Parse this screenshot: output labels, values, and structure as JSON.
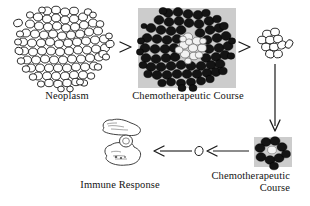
{
  "figure": {
    "type": "biomedical-flow-diagram",
    "background_color": "#ffffff",
    "ink_color": "#141414",
    "plate_background_color": "#cfcfcf",
    "cell_dark_color": "#141414",
    "cell_light_fill": "#ffffff"
  },
  "captions": {
    "neoplasm": "Neoplasm",
    "chemo_course_top": "Chemotherapeutic Course",
    "chemo_course_bottom_line1": "Chemotherapeutic",
    "chemo_course_bottom_line2": "Course",
    "immune_response": "Immune Response"
  },
  "nodes": {
    "neoplasm_cluster": {
      "label": "Neoplasm",
      "description": "large dense cluster of outlined unfilled tumor cells",
      "cell_count": 104,
      "cell_style": "outline"
    },
    "treated_cluster_large": {
      "label": "Chemotherapeutic Course",
      "description": "photographic plate: dark filled tumor cells surrounding a pale white core",
      "cell_count": 96,
      "cell_style": "filled-dark",
      "core_cell_count": 13,
      "core_cell_style": "filled-light"
    },
    "residual_cluster_small": {
      "label": "",
      "description": "small group of surviving outlined cells",
      "cell_count": 11,
      "cell_style": "outline"
    },
    "treated_cluster_small": {
      "label": "Chemotherapeutic Course",
      "description": "photographic plate: small dark cell cluster with pale core",
      "cell_count": 9,
      "cell_style": "filled-dark",
      "core_cell_count": 1,
      "core_cell_style": "filled-light"
    },
    "single_cell": {
      "label": "",
      "description": "single residual outlined cell",
      "cell_count": 1,
      "cell_style": "outline"
    },
    "immune_cells": {
      "label": "Immune Response",
      "description": "two outlined amoeboid immune cells (macrophage / lymphocyte) engulfing target",
      "cell_count": 2,
      "cell_style": "outline-amoeboid"
    }
  },
  "arrows": [
    {
      "name": "neoplasm-to-treated",
      "direction": "right",
      "from": "neoplasm_cluster",
      "to": "treated_cluster_large"
    },
    {
      "name": "treated-to-residual",
      "direction": "right",
      "from": "treated_cluster_large",
      "to": "residual_cluster_small"
    },
    {
      "name": "residual-to-treated-small",
      "direction": "down",
      "from": "residual_cluster_small",
      "to": "treated_cluster_small"
    },
    {
      "name": "treated-small-to-single-cell",
      "direction": "left",
      "from": "treated_cluster_small",
      "to": "single_cell"
    },
    {
      "name": "single-cell-to-immune",
      "direction": "left",
      "from": "single_cell",
      "to": "immune_cells"
    }
  ]
}
